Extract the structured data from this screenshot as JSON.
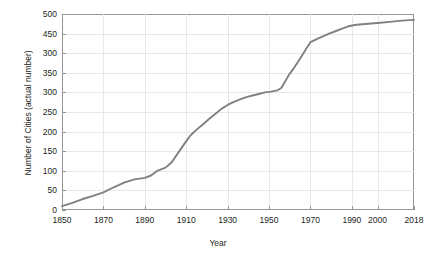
{
  "chart_data": {
    "type": "line",
    "title": "",
    "xlabel": "Year",
    "ylabel": "Number of Cities (actual number)",
    "xlim": [
      1850,
      2018
    ],
    "ylim": [
      0,
      500
    ],
    "grid": true,
    "legend": null,
    "line_color": "#808080",
    "axis_color": "#939598",
    "grid_color": "#e6e7e8",
    "text_color": "#231f20",
    "y_ticks": [
      0,
      50,
      100,
      150,
      200,
      250,
      300,
      350,
      400,
      450,
      500
    ],
    "y_tick_labels": [
      "0",
      "50",
      "100",
      "150",
      "200",
      "250",
      "300",
      "350",
      "300",
      "450",
      "500"
    ],
    "x_ticks": [
      1850,
      1870,
      1890,
      1910,
      1930,
      1950,
      1970,
      1990,
      2000,
      2018
    ],
    "x_tick_labels": [
      "1850",
      "1870",
      "1890",
      "1910",
      "1930",
      "1950",
      "1970",
      "1990",
      "2000",
      "2018"
    ],
    "x_axis_spacing": "non-uniform",
    "series": [
      {
        "name": "Number of Cities",
        "x": [
          1850,
          1855,
          1860,
          1865,
          1870,
          1875,
          1880,
          1885,
          1890,
          1893,
          1896,
          1900,
          1903,
          1906,
          1909,
          1912,
          1915,
          1918,
          1921,
          1924,
          1927,
          1930,
          1933,
          1936,
          1939,
          1942,
          1945,
          1948,
          1951,
          1954,
          1956,
          1958,
          1960,
          1962,
          1964,
          1966,
          1968,
          1970,
          1973,
          1976,
          1979,
          1982,
          1985,
          1988,
          1991,
          1994,
          2000,
          2006,
          2012,
          2018
        ],
        "y": [
          10,
          18,
          28,
          36,
          45,
          58,
          70,
          78,
          82,
          88,
          100,
          108,
          122,
          145,
          168,
          190,
          205,
          218,
          232,
          245,
          258,
          268,
          276,
          282,
          288,
          292,
          296,
          300,
          302,
          305,
          312,
          330,
          348,
          362,
          378,
          395,
          412,
          428,
          436,
          443,
          450,
          456,
          462,
          468,
          472,
          474,
          477,
          480,
          483,
          485
        ]
      }
    ]
  }
}
